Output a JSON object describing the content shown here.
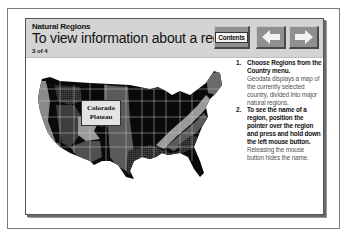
{
  "header": {
    "subtitle": "Natural Regions",
    "title": "To view information about a region",
    "page_counter": "3 of 4"
  },
  "toolbar": {
    "contents_label": "Contents",
    "back_icon": "left-arrow-icon",
    "forward_icon": "right-arrow-icon"
  },
  "map": {
    "callout_line1": "Colorado",
    "callout_line2": "Plateau",
    "colors": {
      "dark": "#0a0a0a",
      "mid_dark": "#3a3a3a",
      "mid": "#5c5c5c",
      "light": "#8a8a8a",
      "lighter": "#a8a8a8",
      "borders": "#c8c8c8"
    }
  },
  "steps": [
    {
      "number": "1.",
      "bold": "Choose Regions from the Country menu.",
      "body": "Geodata displays a map of the currently selected country, divided into major natural regions."
    },
    {
      "number": "2.",
      "bold": "To see the name of a region, position the pointer over the region and press and hold down the left mouse button.",
      "body": "Releasing the mouse button hides the name."
    }
  ]
}
